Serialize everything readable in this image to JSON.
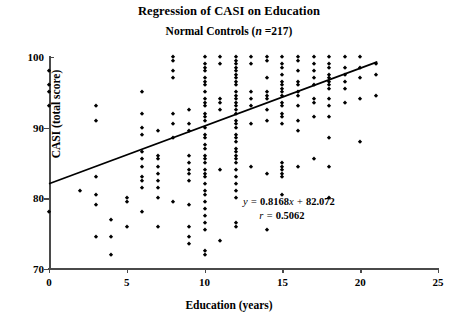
{
  "chart_data": {
    "type": "scatter",
    "title": "Regression of CASI on Education",
    "subtitle_prefix": "Normal Controls (",
    "subtitle_italic": "n",
    "subtitle_suffix": " =217)",
    "xlabel": "Education (years)",
    "ylabel": "CASI (total score)",
    "xlim": [
      0,
      25
    ],
    "ylim": [
      70,
      100
    ],
    "xticks": [
      0,
      5,
      10,
      15,
      20,
      25
    ],
    "yticks": [
      70,
      80,
      90,
      100
    ],
    "grid": false,
    "legend": "none",
    "n": 217,
    "annotations": {
      "equation_y": "y",
      "equation_eq": " = ",
      "equation_slope": "0.8168",
      "equation_x": "x",
      "equation_plus": " + ",
      "equation_intercept": "82.072",
      "equation_full": "y = 0.8168x + 82.072",
      "r_symbol": "r",
      "r_eq": " = ",
      "r_value": "0.5062",
      "r_full": "r = 0.5062"
    },
    "fit": {
      "type": "line",
      "slope": 0.8168,
      "intercept": 82.072,
      "r": 0.5062,
      "x_start": 0,
      "x_end": 21.1,
      "y_start": 82.07,
      "y_end": 99.3
    },
    "points": [
      [
        0,
        98
      ],
      [
        0,
        96
      ],
      [
        0,
        95
      ],
      [
        0,
        93
      ],
      [
        0,
        78
      ],
      [
        2,
        81
      ],
      [
        3,
        93
      ],
      [
        3,
        91
      ],
      [
        3,
        83
      ],
      [
        3,
        80.5
      ],
      [
        3,
        79
      ],
      [
        3,
        74.5
      ],
      [
        4,
        77
      ],
      [
        4,
        74.5
      ],
      [
        4,
        72
      ],
      [
        5,
        80
      ],
      [
        5,
        79.5
      ],
      [
        5,
        76
      ],
      [
        6,
        95
      ],
      [
        6,
        92
      ],
      [
        6,
        90
      ],
      [
        6,
        89
      ],
      [
        6,
        86.5
      ],
      [
        6,
        85.5
      ],
      [
        6,
        84.5
      ],
      [
        6,
        83
      ],
      [
        6,
        82.5
      ],
      [
        6,
        81.5
      ],
      [
        6,
        78
      ],
      [
        7,
        89.5
      ],
      [
        7,
        86
      ],
      [
        7,
        85.5
      ],
      [
        7,
        84.5
      ],
      [
        7,
        83.5
      ],
      [
        7,
        82.5
      ],
      [
        7,
        81.5
      ],
      [
        7,
        80
      ],
      [
        7,
        76
      ],
      [
        8,
        100
      ],
      [
        8,
        99.5
      ],
      [
        8,
        98
      ],
      [
        8,
        97
      ],
      [
        8,
        92
      ],
      [
        8,
        90.5
      ],
      [
        8,
        88.5
      ],
      [
        8,
        79.5
      ],
      [
        9,
        92.5
      ],
      [
        9,
        90.5
      ],
      [
        9,
        89.5
      ],
      [
        9,
        86
      ],
      [
        9,
        85
      ],
      [
        9,
        84
      ],
      [
        9,
        83.5
      ],
      [
        9,
        82.5
      ],
      [
        9,
        79
      ],
      [
        9,
        76
      ],
      [
        9,
        74.5
      ],
      [
        9,
        73.5
      ],
      [
        10,
        100
      ],
      [
        10,
        99
      ],
      [
        10,
        98.5
      ],
      [
        10,
        98
      ],
      [
        10,
        97
      ],
      [
        10,
        96.5
      ],
      [
        10,
        96
      ],
      [
        10,
        95
      ],
      [
        10,
        94
      ],
      [
        10,
        93.5
      ],
      [
        10,
        93
      ],
      [
        10,
        92
      ],
      [
        10,
        91.5
      ],
      [
        10,
        91
      ],
      [
        10,
        90
      ],
      [
        10,
        89
      ],
      [
        10,
        88.5
      ],
      [
        10,
        87.5
      ],
      [
        10,
        87
      ],
      [
        10,
        86
      ],
      [
        10,
        85.5
      ],
      [
        10,
        85
      ],
      [
        10,
        84
      ],
      [
        10,
        83.5
      ],
      [
        10,
        83
      ],
      [
        10,
        82
      ],
      [
        10,
        81
      ],
      [
        10,
        80.5
      ],
      [
        10,
        79.5
      ],
      [
        10,
        78.5
      ],
      [
        10,
        77.5
      ],
      [
        10,
        76.5
      ],
      [
        10,
        75.5
      ],
      [
        10,
        72.5
      ],
      [
        10,
        72
      ],
      [
        11,
        100
      ],
      [
        11,
        99
      ],
      [
        11,
        94
      ],
      [
        11,
        93.5
      ],
      [
        11,
        92.5
      ],
      [
        11,
        84
      ],
      [
        11,
        74
      ],
      [
        12,
        100
      ],
      [
        12,
        99.5
      ],
      [
        12,
        99
      ],
      [
        12,
        98.5
      ],
      [
        12,
        98
      ],
      [
        12,
        97.5
      ],
      [
        12,
        97
      ],
      [
        12,
        96.5
      ],
      [
        12,
        96
      ],
      [
        12,
        95
      ],
      [
        12,
        94.5
      ],
      [
        12,
        94
      ],
      [
        12,
        93.5
      ],
      [
        12,
        93
      ],
      [
        12,
        92.5
      ],
      [
        12,
        92
      ],
      [
        12,
        91
      ],
      [
        12,
        90.5
      ],
      [
        12,
        90
      ],
      [
        12,
        89
      ],
      [
        12,
        88.5
      ],
      [
        12,
        88
      ],
      [
        12,
        87
      ],
      [
        12,
        86.5
      ],
      [
        12,
        86
      ],
      [
        12,
        85.5
      ],
      [
        12,
        85
      ],
      [
        12,
        84
      ],
      [
        12,
        83
      ],
      [
        12,
        82
      ],
      [
        12,
        81
      ],
      [
        12,
        80
      ],
      [
        12,
        76.5
      ],
      [
        12,
        76
      ],
      [
        13,
        100
      ],
      [
        13,
        99
      ],
      [
        13,
        95
      ],
      [
        13,
        94
      ],
      [
        13,
        93
      ],
      [
        13,
        90.5
      ],
      [
        13,
        84.5
      ],
      [
        14,
        100
      ],
      [
        14,
        99.5
      ],
      [
        14,
        97
      ],
      [
        14,
        95
      ],
      [
        14,
        94.5
      ],
      [
        14,
        94
      ],
      [
        14,
        92.5
      ],
      [
        14,
        91
      ],
      [
        14,
        83.5
      ],
      [
        14,
        75.5
      ],
      [
        15,
        100
      ],
      [
        15,
        99
      ],
      [
        15,
        98.5
      ],
      [
        15,
        97.5
      ],
      [
        15,
        96.5
      ],
      [
        15,
        96
      ],
      [
        15,
        95.5
      ],
      [
        15,
        95
      ],
      [
        15,
        94.5
      ],
      [
        15,
        93.5
      ],
      [
        15,
        93
      ],
      [
        15,
        92
      ],
      [
        15,
        91.5
      ],
      [
        15,
        90.5
      ],
      [
        15,
        85
      ],
      [
        15,
        84.5
      ],
      [
        15,
        84
      ],
      [
        15,
        83.5
      ],
      [
        15,
        83
      ],
      [
        15,
        80.5
      ],
      [
        16,
        100
      ],
      [
        16,
        99.5
      ],
      [
        16,
        98
      ],
      [
        16,
        96.5
      ],
      [
        16,
        96
      ],
      [
        16,
        95
      ],
      [
        16,
        94.5
      ],
      [
        16,
        93
      ],
      [
        16,
        91
      ],
      [
        16,
        89.5
      ],
      [
        16,
        84.5
      ],
      [
        17,
        100
      ],
      [
        17,
        99
      ],
      [
        17,
        98
      ],
      [
        17,
        97
      ],
      [
        17,
        96
      ],
      [
        17,
        94
      ],
      [
        17,
        93.5
      ],
      [
        17,
        91.5
      ],
      [
        17,
        85.5
      ],
      [
        18,
        100
      ],
      [
        18,
        99
      ],
      [
        18,
        98.5
      ],
      [
        18,
        97.5
      ],
      [
        18,
        97
      ],
      [
        18,
        96.5
      ],
      [
        18,
        96
      ],
      [
        18,
        95.5
      ],
      [
        18,
        94
      ],
      [
        18,
        93
      ],
      [
        18,
        91.5
      ],
      [
        18,
        88.5
      ],
      [
        18,
        84.5
      ],
      [
        18,
        80
      ],
      [
        19,
        100
      ],
      [
        19,
        98.5
      ],
      [
        19,
        97.5
      ],
      [
        19,
        96.5
      ],
      [
        19,
        95.5
      ],
      [
        19,
        93.5
      ],
      [
        20,
        100
      ],
      [
        20,
        98.5
      ],
      [
        20,
        97
      ],
      [
        20,
        94
      ],
      [
        20,
        88
      ],
      [
        21,
        99
      ],
      [
        21,
        97.5
      ],
      [
        21,
        94.5
      ]
    ]
  }
}
